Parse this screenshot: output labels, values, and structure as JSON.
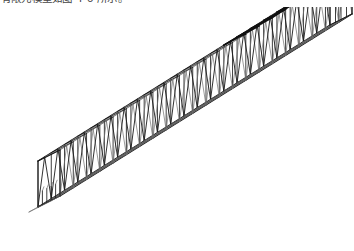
{
  "document": {
    "background_color": "#ffffff",
    "ink_color": "#1b1b1b",
    "light_ink_color": "#8f8f8f",
    "caption_clipped": true,
    "caption_text": "有限元模型如图 4-6 所示。"
  },
  "figure": {
    "name": "space-truss-girder-isometric",
    "projection": "isometric / axonometric",
    "line_style": "thin black wireframe on white, scanned halftone",
    "orientation": "runs from lower-left to upper-right",
    "ends": {
      "near_end": "open rectangular portal frame at lower-left, short vertical stub members visible",
      "far_end": "closed rectangular end frame at upper-right"
    },
    "members": {
      "top_chords": 2,
      "bottom_chords": 2,
      "vertical_posts_per_side": 22,
      "web_pattern": "alternating inverted-V (Warren with verticals) triangles on each side face",
      "top_face_cross_bracing": "dense X cross bracing concentrated over the far (upper-right) third",
      "bottom_face_lattice": "longitudinal bottom lattice with diagonal ties along full span"
    },
    "geometry": {
      "bay_count": 22,
      "start_point_px": [
        38,
        200
      ],
      "end_point_px": [
        330,
        18
      ],
      "depth_px": 46,
      "width_px": 30,
      "width_skew_px": [
        22,
        -11
      ]
    }
  },
  "chart_data": {
    "type": "diagram",
    "categories": [],
    "values": []
  }
}
